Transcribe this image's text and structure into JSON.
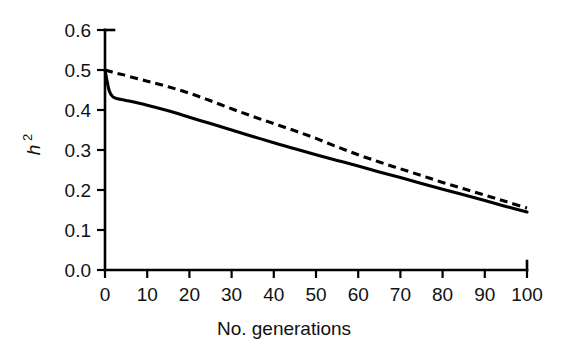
{
  "figure": {
    "background_color": "#ffffff",
    "foreground_color": "#000000",
    "width": 569,
    "height": 355
  },
  "axes": {
    "x_title": "No. generations",
    "y_title_base": "h",
    "y_title_sup": "2",
    "x_tick_labels": [
      "0",
      "10",
      "20",
      "30",
      "40",
      "50",
      "60",
      "70",
      "80",
      "90",
      "100"
    ],
    "y_tick_labels": [
      "0.0",
      "0.1",
      "0.2",
      "0.3",
      "0.4",
      "0.5",
      "0.6"
    ]
  },
  "chart_data": {
    "type": "line",
    "title": "",
    "subtitle": "",
    "xlabel": "No. generations",
    "ylabel": "h2",
    "xlim": [
      0,
      100
    ],
    "ylim": [
      0.0,
      0.6
    ],
    "xticks": [
      0,
      10,
      20,
      30,
      40,
      50,
      60,
      70,
      80,
      90,
      100
    ],
    "yticks": [
      0.0,
      0.1,
      0.2,
      0.3,
      0.4,
      0.5,
      0.6
    ],
    "grid": false,
    "legend": false,
    "legend_position": "none",
    "annotations": [],
    "x": [
      0,
      1,
      2,
      3,
      4,
      5,
      10,
      15,
      20,
      25,
      30,
      35,
      40,
      45,
      50,
      55,
      60,
      65,
      70,
      75,
      80,
      85,
      90,
      95,
      100
    ],
    "series": [
      {
        "name": "solid",
        "style": "solid",
        "color": "#000000",
        "values": [
          0.5,
          0.448,
          0.432,
          0.428,
          0.426,
          0.424,
          0.412,
          0.398,
          0.382,
          0.366,
          0.35,
          0.334,
          0.318,
          0.303,
          0.288,
          0.274,
          0.26,
          0.245,
          0.231,
          0.216,
          0.202,
          0.188,
          0.174,
          0.159,
          0.145
        ]
      },
      {
        "name": "dashed",
        "style": "dashed",
        "color": "#000000",
        "values": [
          0.5,
          0.497,
          0.494,
          0.491,
          0.489,
          0.486,
          0.472,
          0.458,
          0.442,
          0.423,
          0.403,
          0.384,
          0.366,
          0.348,
          0.329,
          0.308,
          0.288,
          0.27,
          0.253,
          0.236,
          0.219,
          0.203,
          0.187,
          0.171,
          0.155
        ]
      }
    ]
  }
}
